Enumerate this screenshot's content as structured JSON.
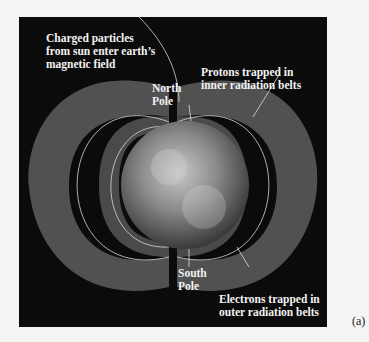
{
  "figure": {
    "label": "(a)"
  },
  "annotations": {
    "charged_particles_line1": "Charged particles",
    "charged_particles_line2": "from sun enter earth’s",
    "charged_particles_line3": "magnetic field",
    "north_pole_line1": "North",
    "north_pole_line2": "Pole",
    "protons_line1": "Protons trapped in",
    "protons_line2": "inner radiation belts",
    "south_pole_line1": "South",
    "south_pole_line2": "Pole",
    "electrons_line1": "Electrons trapped in",
    "electrons_line2": "outer radiation belts"
  },
  "colors": {
    "background": "#0b0b0b",
    "belt": "#6a6a6a",
    "field_line": "#d8d8d8",
    "text": "#f2f2f2"
  }
}
